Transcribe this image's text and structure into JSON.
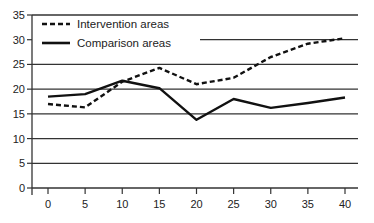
{
  "chart_data": {
    "type": "line",
    "title": "",
    "xlabel": "",
    "ylabel": "",
    "x": [
      0,
      5,
      10,
      15,
      20,
      25,
      30,
      35,
      40
    ],
    "x_ticks": [
      "0",
      "5",
      "10",
      "15",
      "20",
      "25",
      "30",
      "35",
      "40"
    ],
    "y_ticks": [
      "0",
      "5",
      "10",
      "15",
      "20",
      "25",
      "30",
      "35"
    ],
    "ylim": [
      0,
      35
    ],
    "xlim": [
      0,
      40
    ],
    "grid": "horizontal",
    "legend_position": "upper-left",
    "series": [
      {
        "name": "Intervention areas",
        "style": "dashed",
        "values": [
          17.0,
          16.3,
          21.5,
          24.3,
          21.0,
          22.3,
          26.5,
          29.2,
          30.3
        ]
      },
      {
        "name": "Comparison areas",
        "style": "solid",
        "values": [
          18.5,
          19.0,
          21.7,
          20.2,
          13.8,
          18.0,
          16.2,
          17.2,
          18.3
        ]
      }
    ]
  },
  "legend": {
    "items": [
      {
        "label": "Intervention areas",
        "style": "dashed"
      },
      {
        "label": "Comparison areas",
        "style": "solid"
      }
    ]
  },
  "colors": {
    "line": "#111111",
    "grid": "#333333",
    "text": "#222222",
    "background": "#ffffff"
  }
}
